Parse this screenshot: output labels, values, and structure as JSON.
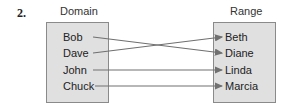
{
  "problem_number": "2.",
  "domain": {
    "title": "Domain",
    "items": [
      "Bob",
      "Dave",
      "John",
      "Chuck"
    ]
  },
  "range": {
    "title": "Range",
    "items": [
      "Beth",
      "Diane",
      "Linda",
      "Marcia"
    ]
  },
  "mappings": [
    {
      "from": "Bob",
      "to": "Diane"
    },
    {
      "from": "Dave",
      "to": "Beth"
    },
    {
      "from": "John",
      "to": "Linda"
    },
    {
      "from": "Chuck",
      "to": "Marcia"
    }
  ],
  "colors": {
    "box_fill": "#e0e0e0",
    "box_border": "#8a8a8a",
    "arrow": "#707070"
  }
}
